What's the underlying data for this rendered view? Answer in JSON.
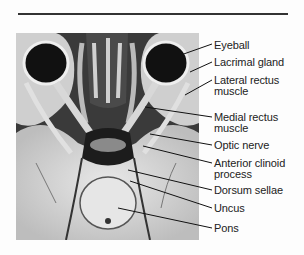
{
  "figure": {
    "labels": [
      {
        "text": "Eyeball",
        "line2": ""
      },
      {
        "text": "Lacrimal gland",
        "line2": ""
      },
      {
        "text": "Lateral rectus",
        "line2": "muscle"
      },
      {
        "text": "Medial rectus",
        "line2": "muscle"
      },
      {
        "text": "Optic nerve",
        "line2": ""
      },
      {
        "text": "Anterior clinoid",
        "line2": "process"
      },
      {
        "text": "Dorsum sellae",
        "line2": ""
      },
      {
        "text": "Uncus",
        "line2": ""
      },
      {
        "text": "Pons",
        "line2": ""
      }
    ]
  }
}
